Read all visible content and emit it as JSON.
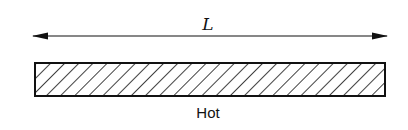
{
  "diagram": {
    "length_label": "L",
    "bar_label": "Hot",
    "dimension_arrow": {
      "x1": 32,
      "x2": 388,
      "y": 36
    },
    "bar": {
      "x": 35,
      "y": 63,
      "width": 350,
      "height": 33,
      "hatch_spacing": 10
    },
    "colors": {
      "stroke": "#111111",
      "background": "#ffffff"
    }
  }
}
